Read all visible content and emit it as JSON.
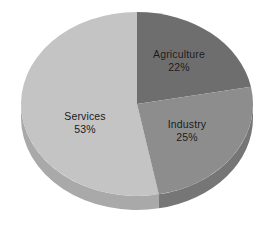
{
  "chart_data": {
    "type": "pie",
    "title": "",
    "subtitle": "",
    "xlabel": "",
    "ylabel": "",
    "categories": [
      "Agriculture",
      "Industry",
      "Services"
    ],
    "values": [
      22,
      25,
      53
    ],
    "units": "percent",
    "total": 100,
    "legend": "none",
    "grid": false,
    "style": "3d-pie",
    "start_angle_deg": 0,
    "rotation": "clockwise from 12 o'clock",
    "labels_inside_slices": true,
    "slices": [
      {
        "name": "Agriculture",
        "value": 22,
        "value_label": "22%",
        "color": "#6e6e6e",
        "side_color": "#5c5c5c",
        "start_deg": 0,
        "end_deg": 79.2
      },
      {
        "name": "Industry",
        "value": 25,
        "value_label": "25%",
        "color": "#8d8d8d",
        "side_color": "#767676",
        "start_deg": 79.2,
        "end_deg": 169.2
      },
      {
        "name": "Services",
        "value": 53,
        "value_label": "53%",
        "color": "#c4c4c4",
        "side_color": "#a9a9a9",
        "start_deg": 169.2,
        "end_deg": 360
      }
    ]
  },
  "labels": {
    "agriculture": {
      "name": "Agriculture",
      "value": "22%"
    },
    "industry": {
      "name": "Industry",
      "value": "25%"
    },
    "services": {
      "name": "Services",
      "value": "53%"
    }
  },
  "colors": {
    "background": "#ffffff",
    "text": "#18181a",
    "agriculture": "#6e6e6e",
    "agriculture_side": "#5c5c5c",
    "industry": "#8d8d8d",
    "industry_side": "#767676",
    "services": "#c4c4c4",
    "services_side": "#a9a9a9",
    "edge": "#9a9a9a"
  },
  "geometry": {
    "center_x": 137,
    "center_y": 104,
    "radius_x": 116,
    "radius_y": 92,
    "depth": 14
  }
}
